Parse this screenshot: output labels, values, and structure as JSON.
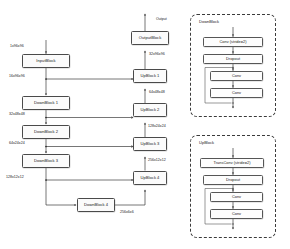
{
  "figure": {
    "output_label": "Output"
  },
  "colors": {
    "block_border": "#4a4a4a",
    "block_fill": "#fbfbfb",
    "panel_border": "#3b3b3b",
    "wire": "#2b2b2b",
    "text": "#1a1a1a"
  },
  "main_graph": {
    "encoder": [
      {
        "id": "input-block",
        "label": "InputBlock"
      },
      {
        "id": "down-block-1",
        "label": "DownBlock 1"
      },
      {
        "id": "down-block-2",
        "label": "DownBlock 2"
      },
      {
        "id": "down-block-3",
        "label": "DownBlock 3"
      },
      {
        "id": "down-block-4",
        "label": "DownBlock 4"
      }
    ],
    "decoder": [
      {
        "id": "up-block-4",
        "label": "UpBlock 4"
      },
      {
        "id": "up-block-3",
        "label": "UpBlock 3"
      },
      {
        "id": "up-block-2",
        "label": "UpBlock 2"
      },
      {
        "id": "up-block-1",
        "label": "UpBlock 1"
      },
      {
        "id": "output-block",
        "label": "OutputBlock"
      }
    ],
    "tensor_shapes": {
      "input": "1x96x96",
      "after_input": "16x96x96",
      "after_down1": "32x48x48",
      "after_down2": "64x24x24",
      "after_down3": "128x12x12",
      "after_down4": "256x6x6",
      "after_up4": "256x12x12",
      "after_up3": "128x24x24",
      "after_up2": "64x48x48",
      "after_up1": "32x96x96"
    }
  },
  "detail_panels": [
    {
      "id": "downblock-detail",
      "title": "DownBlock",
      "layers": [
        {
          "id": "conv-stride2",
          "label": "Conv  (stride=2)"
        },
        {
          "id": "dropout",
          "label": "Dropout"
        },
        {
          "id": "conv-a",
          "label": "Conv"
        },
        {
          "id": "conv-b",
          "label": "Conv"
        }
      ],
      "has_residual": true
    },
    {
      "id": "upblock-detail",
      "title": "UpBlock",
      "layers": [
        {
          "id": "transconv-stride2",
          "label": "TransConv  (stride=2)"
        },
        {
          "id": "dropout",
          "label": "Dropout"
        },
        {
          "id": "conv-a",
          "label": "Conv"
        },
        {
          "id": "conv-b",
          "label": "Conv"
        }
      ],
      "has_residual": true
    }
  ]
}
